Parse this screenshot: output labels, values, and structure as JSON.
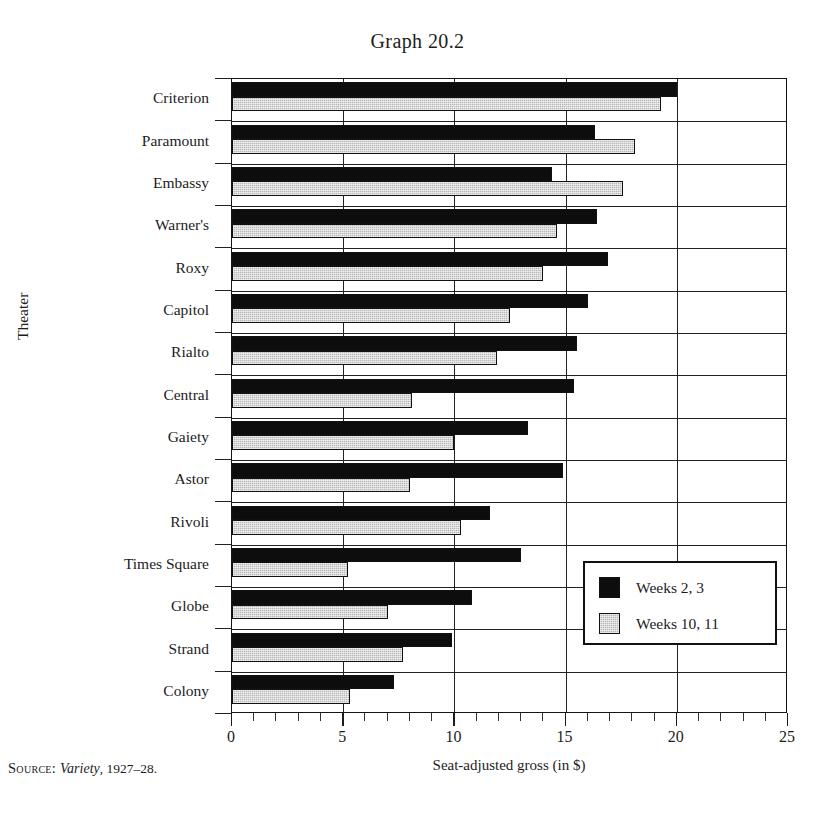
{
  "figure": {
    "title": "Graph 20.2",
    "source_prefix": "Source:",
    "source_italic": "Variety",
    "source_rest": ", 1927–28."
  },
  "axes": {
    "y_title": "Theater",
    "x_title": "Seat-adjusted gross (in $)",
    "x_ticks": [
      "0",
      "5",
      "10",
      "15",
      "20",
      "25"
    ]
  },
  "legend": {
    "items": [
      {
        "label": "Weeks 2, 3",
        "color": "#0d0d0d",
        "key": "weeks_2_3"
      },
      {
        "label": "Weeks 10, 11",
        "color": "#b9b9b9",
        "key": "weeks_10_11"
      }
    ]
  },
  "chart_data": {
    "type": "bar",
    "orientation": "horizontal",
    "title": "Graph 20.2",
    "xlabel": "Seat-adjusted gross (in $)",
    "ylabel": "Theater",
    "xlim": [
      0,
      25
    ],
    "xticks": [
      0,
      5,
      10,
      15,
      20,
      25
    ],
    "minor_tick_step": 1,
    "grid": "vertical-major-and-horizontal-category",
    "legend_position": "inside-lower-right",
    "categories": [
      "Criterion",
      "Paramount",
      "Embassy",
      "Warner's",
      "Roxy",
      "Capitol",
      "Rialto",
      "Central",
      "Gaiety",
      "Astor",
      "Rivoli",
      "Times Square",
      "Globe",
      "Strand",
      "Colony"
    ],
    "series": [
      {
        "name": "Weeks 2, 3",
        "color": "#0d0d0d",
        "values": [
          20.0,
          16.3,
          14.4,
          16.4,
          16.9,
          16.0,
          15.5,
          15.4,
          13.3,
          14.9,
          11.6,
          13.0,
          10.8,
          9.9,
          7.3
        ]
      },
      {
        "name": "Weeks 10, 11",
        "color": "#b9b9b9",
        "values": [
          19.3,
          18.1,
          17.6,
          14.6,
          14.0,
          12.5,
          11.9,
          8.1,
          10.0,
          8.0,
          10.3,
          5.2,
          7.0,
          7.7,
          5.3
        ]
      }
    ]
  }
}
